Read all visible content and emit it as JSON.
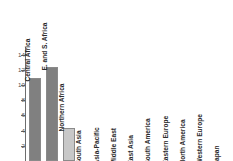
{
  "chart_data": {
    "type": "bar",
    "title": "",
    "subtitle": "",
    "xlabel": "",
    "ylabel": "",
    "ylim": [
      0,
      15
    ],
    "grid": false,
    "legend": "none",
    "y_ticks": [
      2,
      4,
      6,
      8,
      10,
      12,
      14
    ],
    "categories": [
      "Central Africa",
      "E. and S. Africa",
      "Northern Africa",
      "South Asia",
      "Asia-Pacific",
      "Middle East",
      "East Asia",
      "South America",
      "Eastern Europe",
      "North America",
      "Western Europe",
      "Japan"
    ],
    "values": [
      10.9,
      12.4,
      4.3,
      null,
      null,
      null,
      null,
      null,
      null,
      null,
      null,
      null
    ],
    "bar_colors": [
      "#808080",
      "#808080",
      "#c8c8c8",
      "#c8c8c8",
      "#c8c8c8",
      "#c8c8c8",
      "#c8c8c8",
      "#c8c8c8",
      "#c8c8c8",
      "#c8c8c8",
      "#c8c8c8",
      "#c8c8c8"
    ],
    "axis_color": "#6e6e6e",
    "tick_label_color": "#4d4d4d",
    "category_label_color": "#2b2b2b"
  }
}
